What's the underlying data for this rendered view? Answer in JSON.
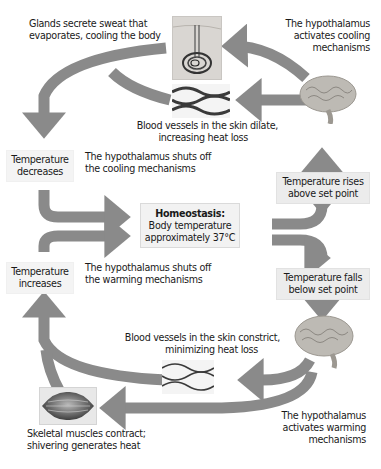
{
  "diagram": {
    "colors": {
      "arrow": "#8a8a8a",
      "box_bg": "#ececec",
      "text": "#1a1a1a"
    },
    "center": {
      "heading": "Homeostasis:",
      "line1": "Body temperature",
      "line2": "approximately 37°C"
    },
    "cooling_loop": {
      "stimulus": {
        "line1": "Temperature rises",
        "line2": "above set point"
      },
      "control_center": {
        "line1": "The hypothalamus",
        "line2": "activates cooling",
        "line3": "mechanisms",
        "icon": "brain-icon"
      },
      "effector_sweat": {
        "line1": "Glands secrete sweat that",
        "line2": "evaporates, cooling the body",
        "icon": "sweat-gland-icon"
      },
      "effector_vessels": {
        "line1": "Blood vessels in the skin dilate,",
        "line2": "increasing heat loss",
        "icon": "blood-vessels-icon"
      },
      "response": {
        "line1": "Temperature",
        "line2": "decreases"
      },
      "feedback": {
        "line1": "The hypothalamus shuts off",
        "line2": "the cooling mechanisms"
      }
    },
    "warming_loop": {
      "stimulus": {
        "line1": "Temperature falls",
        "line2": "below set point"
      },
      "control_center": {
        "line1": "The hypothalamus",
        "line2": "activates warming",
        "line3": "mechanisms",
        "icon": "brain-icon"
      },
      "effector_vessels": {
        "line1": "Blood vessels in the skin constrict,",
        "line2": "minimizing heat loss",
        "icon": "blood-vessels-icon"
      },
      "effector_muscles": {
        "line1": "Skeletal muscles contract;",
        "line2": "shivering generates heat",
        "icon": "muscle-icon"
      },
      "response": {
        "line1": "Temperature",
        "line2": "increases"
      },
      "feedback": {
        "line1": "The hypothalamus shuts off",
        "line2": "the warming mechanisms"
      }
    }
  }
}
